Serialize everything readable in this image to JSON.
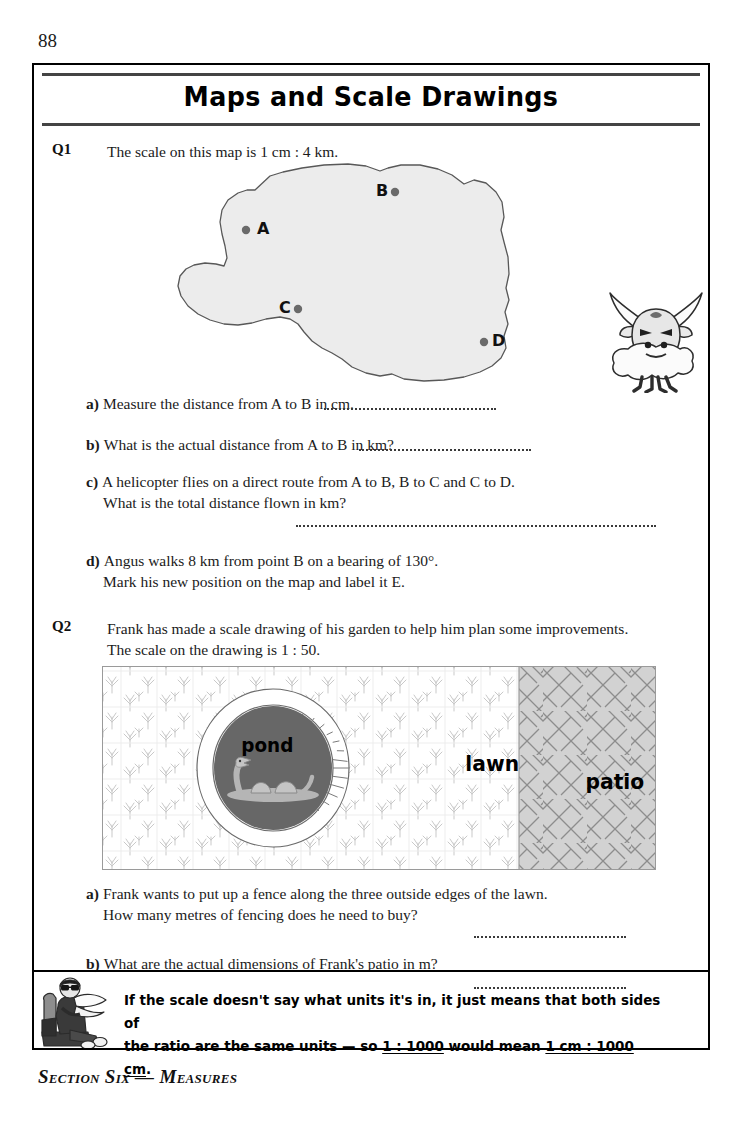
{
  "page": {
    "number": "88",
    "title": "Maps and Scale Drawings",
    "footer": "Section Six — Measures"
  },
  "q1": {
    "label": "Q1",
    "stem": "The scale on this map is 1 cm : 4 km.",
    "map": {
      "points": [
        {
          "id": "A",
          "label": "A",
          "x": 94,
          "y": 68
        },
        {
          "id": "B",
          "label": "B",
          "x": 243,
          "y": 30
        },
        {
          "id": "C",
          "label": "C",
          "x": 146,
          "y": 147
        },
        {
          "id": "D",
          "label": "D",
          "x": 332,
          "y": 180
        }
      ],
      "fill_color": "#ececec",
      "outline_color": "#4a4a4a",
      "dot_color": "#6a6a6a"
    },
    "parts": [
      {
        "letter": "a)",
        "lines": [
          "Measure the distance from A to B in cm."
        ],
        "answer_line": "inline"
      },
      {
        "letter": "b)",
        "lines": [
          "What is the actual distance from A to B in km?"
        ],
        "answer_line": "inline"
      },
      {
        "letter": "c)",
        "lines": [
          "A helicopter flies on a direct route from A to B, B to C and C to D.",
          "What is the total distance flown in km?"
        ],
        "answer_line": "below-long"
      },
      {
        "letter": "d)",
        "lines": [
          "Angus walks 8 km from point B on a bearing of 130°.",
          "Mark his new position on the map and label it E."
        ],
        "answer_line": "none"
      }
    ]
  },
  "q2": {
    "label": "Q2",
    "stem_lines": [
      "Frank has made a scale drawing of his garden to help him plan some improvements.",
      "The scale on the drawing is 1 : 50."
    ],
    "garden": {
      "areas": [
        {
          "name": "pond",
          "label": "pond",
          "fill_color": "#676767"
        },
        {
          "name": "lawn",
          "label": "lawn",
          "fill_color": "#ffffff"
        },
        {
          "name": "patio",
          "label": "patio",
          "fill_color": "#d2d2d2"
        }
      ],
      "pond_ring_color": "#ffffff",
      "grass_color": "#c9c9c9",
      "patio_line_color": "#8d8d8d",
      "border_color": "#9a9a9a"
    },
    "parts": [
      {
        "letter": "a)",
        "lines": [
          "Frank wants to put up a fence along the three outside edges of the lawn.",
          "How many metres of fencing does he need to buy?"
        ],
        "answer_line": "below"
      },
      {
        "letter": "b)",
        "lines": [
          "What are the actual dimensions of Frank's patio in m?"
        ],
        "answer_line": "below"
      }
    ]
  },
  "tip": {
    "line1": "If the scale doesn't say what units it's in, it just means that both sides of",
    "line2_pre": "the ratio are the same units — so ",
    "line2_u1": "1 : 1000",
    "line2_mid": " would mean ",
    "line2_u2": "1 cm : 1000 cm",
    "line2_post": "."
  }
}
